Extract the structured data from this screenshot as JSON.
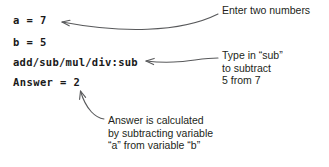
{
  "canvas": {
    "width": 329,
    "height": 167,
    "background": "#ffffff",
    "ink": "#231f20",
    "arrow_color": "#58595b"
  },
  "code": {
    "line_a": "a = 7",
    "line_b": "b = 5",
    "line_operation": "add/sub/mul/div:sub",
    "line_answer": "Answer = 2"
  },
  "annotations": {
    "inputs_note": "Enter two numbers",
    "operation_note": "Type in “sub”\nto subtract\n5 from 7",
    "answer_note": "Answer is calculated\nby subtracting variable\n“a” from variable “b”"
  },
  "arrows": [
    {
      "name": "arrow-to-inputs",
      "from": "inputs_note",
      "to": "line_a",
      "direction": "left"
    },
    {
      "name": "arrow-to-operation",
      "from": "operation_note",
      "to": "line_operation",
      "direction": "left"
    },
    {
      "name": "arrow-to-answer",
      "from": "answer_note",
      "to": "line_answer",
      "direction": "up-left"
    }
  ]
}
